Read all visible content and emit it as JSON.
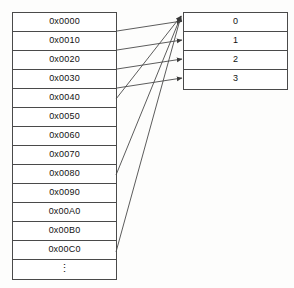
{
  "figure": {
    "caption": "",
    "stroke_color": "#4a4a4a",
    "text_color": "#111111",
    "background_color": "#fdfdfc"
  },
  "memory_table": {
    "name": "memory-address-table",
    "rows": [
      {
        "label": "0x0000"
      },
      {
        "label": "0x0010"
      },
      {
        "label": "0x0020"
      },
      {
        "label": "0x0030"
      },
      {
        "label": "0x0040"
      },
      {
        "label": "0x0050"
      },
      {
        "label": "0x0060"
      },
      {
        "label": "0x0070"
      },
      {
        "label": "0x0080"
      },
      {
        "label": "0x0090"
      },
      {
        "label": "0x00A0"
      },
      {
        "label": "0x00B0"
      },
      {
        "label": "0x00C0"
      },
      {
        "label": "⋮"
      }
    ]
  },
  "index_table": {
    "name": "index-table",
    "rows": [
      {
        "label": "0"
      },
      {
        "label": "1"
      },
      {
        "label": "2"
      },
      {
        "label": "3"
      }
    ]
  },
  "connectors": [
    {
      "name": "arrow-0x0000-to-index-0",
      "from": "0x0000",
      "to": "0",
      "style": "horizontal"
    },
    {
      "name": "arrow-0x0010-to-index-1",
      "from": "0x0010",
      "to": "1",
      "style": "horizontal"
    },
    {
      "name": "arrow-0x0020-to-index-2",
      "from": "0x0020",
      "to": "2",
      "style": "horizontal"
    },
    {
      "name": "arrow-0x0030-to-index-3",
      "from": "0x0030",
      "to": "3",
      "style": "horizontal"
    },
    {
      "name": "arrow-0x0040-to-index-0",
      "from": "0x0040",
      "to": "0",
      "style": "diagonal"
    },
    {
      "name": "arrow-0x0080-to-index-0",
      "from": "0x0080",
      "to": "0",
      "style": "diagonal"
    },
    {
      "name": "arrow-0x00C0-to-index-0",
      "from": "0x00C0",
      "to": "0",
      "style": "diagonal"
    }
  ]
}
